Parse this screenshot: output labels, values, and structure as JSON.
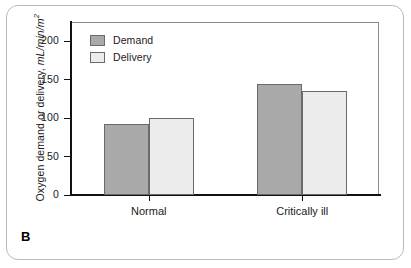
{
  "figure": {
    "panel_label": "B"
  },
  "chart_data": {
    "type": "bar",
    "title": "",
    "subtitle": "",
    "xlabel": "",
    "ylabel_main": "Oxygen demand or delivery,",
    "ylabel_units": "mL/min/m",
    "ylabel_units_exponent": "2",
    "categories": [
      "Normal",
      "Critically ill"
    ],
    "series": [
      {
        "name": "Demand",
        "values": [
          92,
          145
        ],
        "color": "#a9a9a9"
      },
      {
        "name": "Delivery",
        "values": [
          100,
          135
        ],
        "color": "#ececec"
      }
    ],
    "ylim": [
      0,
      225
    ],
    "yticks": [
      0,
      50,
      100,
      150,
      200
    ],
    "ytick_labels": [
      "0",
      "50",
      "100",
      "150",
      "200"
    ],
    "grid": false,
    "legend_position": "top-left-inside"
  },
  "colors": {
    "demand_fill": "#a9a9a9",
    "delivery_fill": "#ececec",
    "bar_border": "#6a6a6a",
    "axis": "#111111",
    "frame": "#8c8c8c",
    "panel_border": "#b9b9b9",
    "background": "#ffffff"
  }
}
